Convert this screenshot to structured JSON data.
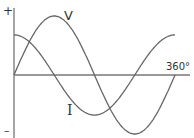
{
  "diagram": {
    "title": "",
    "labels": {
      "plus": "+",
      "minus": "–",
      "voltage": "V",
      "current": "I",
      "end_angle": "360°"
    },
    "curves": [
      {
        "name": "V",
        "amplitude": 1.0,
        "phase_deg": 0
      },
      {
        "name": "I",
        "amplitude": 0.68,
        "phase_deg": 90
      }
    ],
    "colors": {
      "line": "#666666",
      "axis": "#777777",
      "text": "#333333"
    }
  }
}
